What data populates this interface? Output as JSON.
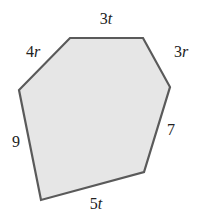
{
  "figure": {
    "shape": "hexagon",
    "fill_color": "#e6e6e6",
    "stroke_color": "#5a5a5a",
    "vertices": [
      [
        70,
        38
      ],
      [
        143,
        38
      ],
      [
        170,
        87
      ],
      [
        144,
        172
      ],
      [
        41,
        200
      ],
      [
        19,
        90
      ]
    ],
    "sides": [
      {
        "id": "top",
        "coef": "3",
        "var": "t",
        "x": 106,
        "y": 19
      },
      {
        "id": "upper-right",
        "coef": "3",
        "var": "r",
        "x": 181,
        "y": 52
      },
      {
        "id": "right",
        "coef": "7",
        "var": "",
        "x": 171,
        "y": 130
      },
      {
        "id": "bottom",
        "coef": "5",
        "var": "t",
        "x": 96,
        "y": 204
      },
      {
        "id": "left",
        "coef": "9",
        "var": "",
        "x": 16,
        "y": 142
      },
      {
        "id": "upper-left",
        "coef": "4",
        "var": "r",
        "x": 33,
        "y": 52
      }
    ]
  }
}
